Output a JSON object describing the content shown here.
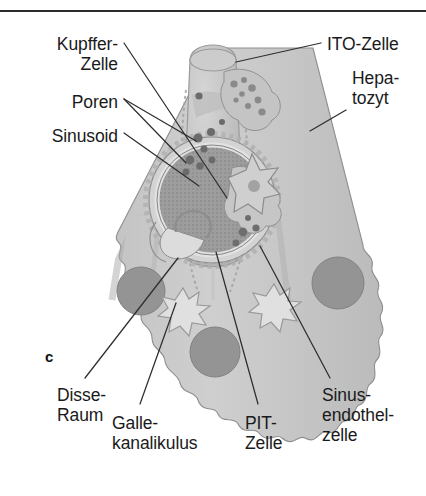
{
  "figure": {
    "panel_letter": "c",
    "rule_color": "#2b2b2b",
    "background_color": "#ffffff"
  },
  "labels": [
    {
      "id": "kupffer",
      "text": "Kupffer-\nZelle",
      "align": "right",
      "x": 118,
      "y": 34
    },
    {
      "id": "poren",
      "text": "Poren",
      "align": "right",
      "x": 118,
      "y": 92
    },
    {
      "id": "sinusoid",
      "text": "Sinusoid",
      "align": "right",
      "x": 118,
      "y": 126
    },
    {
      "id": "ito",
      "text": "ITO-Zelle",
      "align": "left",
      "x": 327,
      "y": 34
    },
    {
      "id": "hepatozyt",
      "text": "Hepa-\ntozyt",
      "align": "left",
      "x": 352,
      "y": 68
    },
    {
      "id": "disse",
      "text": "Disse-\nRaum",
      "align": "left",
      "x": 57,
      "y": 385
    },
    {
      "id": "galle",
      "text": "Galle-\nkanalikulus",
      "align": "left",
      "x": 112,
      "y": 413
    },
    {
      "id": "pit",
      "text": "PIT-\nZelle",
      "align": "left",
      "x": 245,
      "y": 413
    },
    {
      "id": "sinusendothel",
      "text": "Sinus-\nendothel-\nzelle",
      "align": "left",
      "x": 322,
      "y": 385
    }
  ],
  "anatomy": {
    "tissue_color": "#c9c9c9",
    "tissue_shade": "#b5b5b5",
    "nucleus_color": "#949494",
    "lumen_color": "#a0a0a0",
    "outline_color": "#7d7d7d",
    "leader_color": "#2e2e2e",
    "nuclei_count": 3,
    "bile_canaliculi_count": 2,
    "pores_count": 9
  },
  "leaders": [
    {
      "id": "leader-kupffer",
      "x1": 124,
      "y1": 43,
      "x2": 227,
      "y2": 198
    },
    {
      "id": "leader-poren-a",
      "x1": 124,
      "y1": 99,
      "x2": 196,
      "y2": 141
    },
    {
      "id": "leader-poren-b",
      "x1": 124,
      "y1": 99,
      "x2": 186,
      "y2": 163
    },
    {
      "id": "leader-sinusoid",
      "x1": 124,
      "y1": 133,
      "x2": 199,
      "y2": 186
    },
    {
      "id": "leader-ito",
      "x1": 321,
      "y1": 43,
      "x2": 236,
      "y2": 62
    },
    {
      "id": "leader-hepatozyt",
      "x1": 346,
      "y1": 110,
      "x2": 310,
      "y2": 131
    },
    {
      "id": "leader-disse",
      "x1": 85,
      "y1": 378,
      "x2": 178,
      "y2": 258
    },
    {
      "id": "leader-galle",
      "x1": 140,
      "y1": 404,
      "x2": 176,
      "y2": 303
    },
    {
      "id": "leader-pit",
      "x1": 258,
      "y1": 404,
      "x2": 216,
      "y2": 252
    },
    {
      "id": "leader-sinusendothel",
      "x1": 330,
      "y1": 378,
      "x2": 260,
      "y2": 246
    }
  ]
}
